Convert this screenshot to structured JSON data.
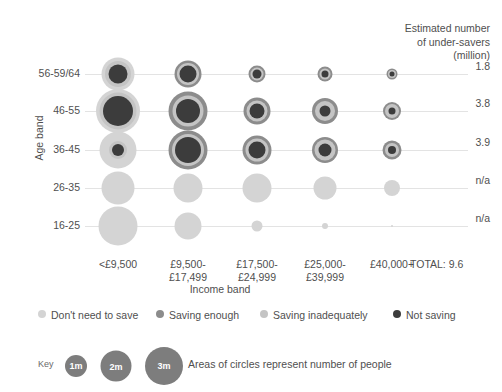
{
  "header": {
    "line1": "Estimated number",
    "line2": "of under-savers",
    "line3": "(million)"
  },
  "axes": {
    "y_title": "Age band",
    "x_title": "Income band",
    "y_ticks": [
      "56-59/64",
      "46-55",
      "36-45",
      "26-35",
      "16-25"
    ],
    "x_ticks": [
      {
        "line1": "<£9,500",
        "line2": ""
      },
      {
        "line1": "£9,500-",
        "line2": "£17,499"
      },
      {
        "line1": "£17,500-",
        "line2": "£24,999"
      },
      {
        "line1": "£25,000-",
        "line2": "£39,999"
      },
      {
        "line1": "£40,000+",
        "line2": ""
      }
    ],
    "total_label": "TOTAL: 9.6"
  },
  "row_values": [
    "1.8",
    "3.8",
    "3.9",
    "n/a",
    "n/a"
  ],
  "colors": {
    "dont_need": "#d4d4d4",
    "saving_enough": "#8c8c8c",
    "saving_inadequately": "#c4c4c4",
    "not_saving": "#3c3c3c",
    "gridline": "#e3e3e3",
    "key_circle": "#7d7d7d",
    "text": "#4f4f4f"
  },
  "legend": [
    {
      "label": "Don't need to save",
      "color": "#d4d4d4",
      "left": 0
    },
    {
      "label": "Saving enough",
      "color": "#8c8c8c",
      "left": 118
    },
    {
      "label": "Saving inadequately",
      "color": "#c4c4c4",
      "left": 222
    },
    {
      "label": "Not saving",
      "color": "#3c3c3c",
      "left": 355
    }
  ],
  "key": {
    "word": "Key",
    "note": "Areas of circles represent number of people",
    "circles": [
      {
        "label": "1m",
        "d": 22,
        "cx": 38
      },
      {
        "label": "2m",
        "d": 31,
        "cx": 78
      },
      {
        "label": "3m",
        "d": 38,
        "cx": 126
      }
    ]
  },
  "chart_data": {
    "type": "scatter",
    "xlabel": "Income band",
    "ylabel": "Age band",
    "note": "Areas of circles represent number of people. Nested circles: outer ring = largest category, inner = smaller categories.",
    "categories_x": [
      "<£9,500",
      "£9,500-£17,499",
      "£17,500-£24,999",
      "£25,000-£39,999",
      "£40,000+"
    ],
    "categories_y": [
      "56-59/64",
      "46-55",
      "36-45",
      "26-35",
      "16-25"
    ],
    "series": [
      {
        "name": "Don't need to save",
        "color": "#d4d4d4"
      },
      {
        "name": "Saving enough",
        "color": "#8c8c8c"
      },
      {
        "name": "Saving inadequately",
        "color": "#c4c4c4"
      },
      {
        "name": "Not saving",
        "color": "#3c3c3c"
      }
    ],
    "estimated_under_savers_million": {
      "56-59/64": "1.8",
      "46-55": "3.8",
      "36-45": "3.9",
      "26-35": "n/a",
      "16-25": "n/a",
      "TOTAL": "9.6"
    },
    "bubbles": [
      {
        "row": 0,
        "col": 0,
        "layers": [
          {
            "c": "#d4d4d4",
            "d": 33
          },
          {
            "c": "#c4c4c4",
            "d": 26
          },
          {
            "c": "#3c3c3c",
            "d": 19
          }
        ]
      },
      {
        "row": 0,
        "col": 1,
        "layers": [
          {
            "c": "#8c8c8c",
            "d": 27
          },
          {
            "c": "#c4c4c4",
            "d": 22
          },
          {
            "c": "#3c3c3c",
            "d": 17
          }
        ]
      },
      {
        "row": 0,
        "col": 2,
        "layers": [
          {
            "c": "#8c8c8c",
            "d": 17
          },
          {
            "c": "#c4c4c4",
            "d": 13
          },
          {
            "c": "#3c3c3c",
            "d": 9
          }
        ]
      },
      {
        "row": 0,
        "col": 3,
        "layers": [
          {
            "c": "#8c8c8c",
            "d": 15
          },
          {
            "c": "#c4c4c4",
            "d": 11
          },
          {
            "c": "#3c3c3c",
            "d": 7
          }
        ]
      },
      {
        "row": 0,
        "col": 4,
        "layers": [
          {
            "c": "#8c8c8c",
            "d": 11
          },
          {
            "c": "#c4c4c4",
            "d": 8
          },
          {
            "c": "#3c3c3c",
            "d": 5
          }
        ]
      },
      {
        "row": 1,
        "col": 0,
        "layers": [
          {
            "c": "#d4d4d4",
            "d": 44
          },
          {
            "c": "#c4c4c4",
            "d": 37
          },
          {
            "c": "#3c3c3c",
            "d": 30
          }
        ]
      },
      {
        "row": 1,
        "col": 1,
        "layers": [
          {
            "c": "#8c8c8c",
            "d": 39
          },
          {
            "c": "#c4c4c4",
            "d": 31
          },
          {
            "c": "#3c3c3c",
            "d": 24
          }
        ]
      },
      {
        "row": 1,
        "col": 2,
        "layers": [
          {
            "c": "#8c8c8c",
            "d": 27
          },
          {
            "c": "#c4c4c4",
            "d": 21
          },
          {
            "c": "#3c3c3c",
            "d": 15
          }
        ]
      },
      {
        "row": 1,
        "col": 3,
        "layers": [
          {
            "c": "#8c8c8c",
            "d": 26
          },
          {
            "c": "#c4c4c4",
            "d": 20
          },
          {
            "c": "#3c3c3c",
            "d": 11
          }
        ]
      },
      {
        "row": 1,
        "col": 4,
        "layers": [
          {
            "c": "#8c8c8c",
            "d": 18
          },
          {
            "c": "#c4c4c4",
            "d": 14
          },
          {
            "c": "#3c3c3c",
            "d": 7
          }
        ]
      },
      {
        "row": 2,
        "col": 0,
        "layers": [
          {
            "c": "#d4d4d4",
            "d": 37
          },
          {
            "c": "#c4c4c4",
            "d": 18
          },
          {
            "c": "#3c3c3c",
            "d": 12
          }
        ]
      },
      {
        "row": 2,
        "col": 1,
        "layers": [
          {
            "c": "#8c8c8c",
            "d": 39
          },
          {
            "c": "#c4c4c4",
            "d": 32
          },
          {
            "c": "#3c3c3c",
            "d": 26
          }
        ]
      },
      {
        "row": 2,
        "col": 2,
        "layers": [
          {
            "c": "#8c8c8c",
            "d": 29
          },
          {
            "c": "#c4c4c4",
            "d": 23
          },
          {
            "c": "#3c3c3c",
            "d": 17
          }
        ]
      },
      {
        "row": 2,
        "col": 3,
        "layers": [
          {
            "c": "#8c8c8c",
            "d": 26
          },
          {
            "c": "#c4c4c4",
            "d": 21
          },
          {
            "c": "#3c3c3c",
            "d": 13
          }
        ]
      },
      {
        "row": 2,
        "col": 4,
        "layers": [
          {
            "c": "#8c8c8c",
            "d": 19
          },
          {
            "c": "#c4c4c4",
            "d": 14
          },
          {
            "c": "#3c3c3c",
            "d": 8
          }
        ]
      },
      {
        "row": 3,
        "col": 0,
        "layers": [
          {
            "c": "#d4d4d4",
            "d": 33
          }
        ]
      },
      {
        "row": 3,
        "col": 1,
        "layers": [
          {
            "c": "#d4d4d4",
            "d": 29
          }
        ]
      },
      {
        "row": 3,
        "col": 2,
        "layers": [
          {
            "c": "#d4d4d4",
            "d": 29
          }
        ]
      },
      {
        "row": 3,
        "col": 3,
        "layers": [
          {
            "c": "#d4d4d4",
            "d": 23
          }
        ]
      },
      {
        "row": 3,
        "col": 4,
        "layers": [
          {
            "c": "#d4d4d4",
            "d": 16
          }
        ]
      },
      {
        "row": 4,
        "col": 0,
        "layers": [
          {
            "c": "#d4d4d4",
            "d": 39
          }
        ]
      },
      {
        "row": 4,
        "col": 1,
        "layers": [
          {
            "c": "#d4d4d4",
            "d": 27
          }
        ]
      },
      {
        "row": 4,
        "col": 2,
        "layers": [
          {
            "c": "#d4d4d4",
            "d": 11
          }
        ]
      },
      {
        "row": 4,
        "col": 3,
        "layers": [
          {
            "c": "#d4d4d4",
            "d": 6
          }
        ]
      },
      {
        "row": 4,
        "col": 4,
        "layers": [
          {
            "c": "#d4d4d4",
            "d": 2
          }
        ]
      }
    ]
  },
  "layout": {
    "col_x": [
      33,
      103,
      172,
      240,
      307
    ],
    "row_y": [
      16,
      53,
      92,
      130,
      168
    ]
  }
}
